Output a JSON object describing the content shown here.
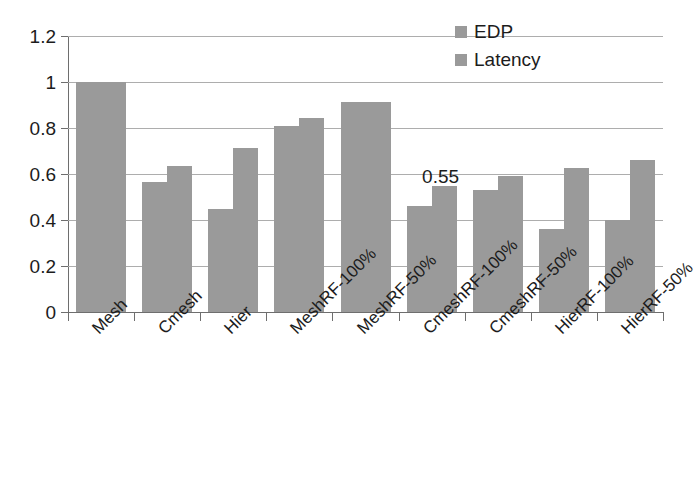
{
  "chart_data": {
    "type": "bar",
    "title": "",
    "xlabel": "",
    "ylabel": "",
    "ylim": [
      0,
      1.2
    ],
    "ytick_labels": [
      "0",
      "0.2",
      "0.4",
      "0.6",
      "0.8",
      "1",
      "1.2"
    ],
    "ytick_values": [
      0,
      0.2,
      0.4,
      0.6,
      0.8,
      1,
      1.2
    ],
    "grid": true,
    "legend_position": "top-right",
    "categories": [
      "Mesh",
      "Cmesh",
      "Hier",
      "MeshRF-100%",
      "MeshRF-50%",
      "CmeshRF-100%",
      "CmeshRF-50%",
      "HierRF-100%",
      "HierRF-50%"
    ],
    "series": [
      {
        "name": "EDP",
        "color": "#9a9a9a",
        "values": [
          1.0,
          0.565,
          0.45,
          0.81,
          0.915,
          0.46,
          0.53,
          0.36,
          0.4
        ]
      },
      {
        "name": "Latency",
        "color": "#9a9a9a",
        "values": [
          1.0,
          0.635,
          0.715,
          0.845,
          0.915,
          0.55,
          0.59,
          0.625,
          0.66
        ]
      }
    ],
    "annotations": [
      {
        "text": "0.55",
        "category": "CmeshRF-100%",
        "series": "Latency",
        "value": 0.55
      }
    ]
  },
  "legend": {
    "items": [
      {
        "label": "EDP"
      },
      {
        "label": "Latency"
      }
    ]
  },
  "colors": {
    "bar": "#9a9a9a",
    "axis": "#6e6e6e",
    "grid": "#adadad",
    "text": "#1c1c1c",
    "background": "#ffffff"
  }
}
